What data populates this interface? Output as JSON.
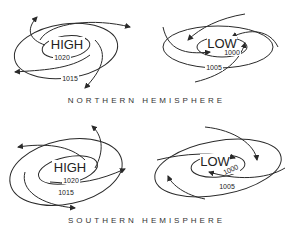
{
  "panels": [
    {
      "hemisphere": "NORTHERN HEMISPHERE",
      "high": {
        "label": "HIGH",
        "isobars": [
          "1020",
          "1015"
        ],
        "circulation": "clockwise, outward"
      },
      "low": {
        "label": "LOW",
        "isobars": [
          "1000",
          "1005"
        ],
        "circulation": "counterclockwise, inward"
      }
    },
    {
      "hemisphere": "SOUTHERN HEMISPHERE",
      "high": {
        "label": "HIGH",
        "isobars": [
          "1020",
          "1015"
        ],
        "circulation": "counterclockwise, outward"
      },
      "low": {
        "label": "LOW",
        "isobars": [
          "1000",
          "1005"
        ],
        "circulation": "clockwise, inward"
      }
    }
  ],
  "colors": {
    "line": "#2a2a2a",
    "text": "#222222",
    "background": "#ffffff"
  }
}
